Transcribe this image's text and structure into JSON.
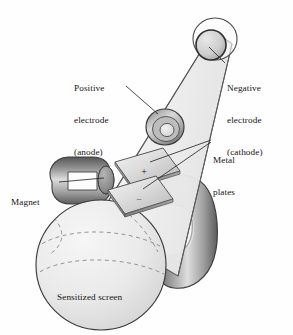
{
  "figure": {
    "background_color": "#fefefe",
    "ink_color": "#141414"
  },
  "labels": {
    "anode": {
      "line1": "Positive",
      "line2": "electrode",
      "line3": "(anode)"
    },
    "cathode": {
      "line1": "Negative",
      "line2": "electrode",
      "line3": "(cathode)"
    },
    "plates": {
      "line1": "Metal",
      "line2": "plates"
    },
    "magnet": {
      "line1": "Magnet"
    },
    "screen": {
      "line1": "Sensitized screen"
    }
  },
  "plate_signs": {
    "positive": "+",
    "negative": "−"
  },
  "colors": {
    "tube_fill": "#f2f2f2",
    "tube_stroke": "#4a4a4a",
    "magnet_dark": "#5f5f5f",
    "magnet_light": "#d8d8d8",
    "plate_light": "#e3e3e3",
    "plate_dark": "#9a9a9a",
    "screen_fill": "#e9e9e9",
    "electrode_dark": "#5a5a5a",
    "leader_line": "#2a2a2a"
  }
}
